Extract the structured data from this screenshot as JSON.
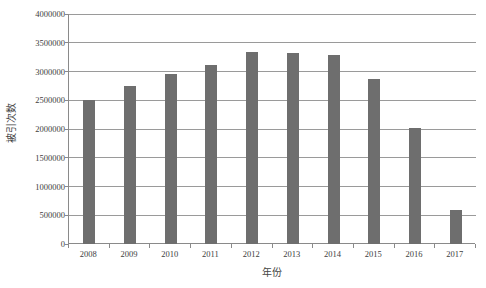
{
  "chart_data": {
    "type": "bar",
    "title": "",
    "subtitle": "",
    "xlabel": "年份",
    "ylabel": "被引次数",
    "categories": [
      "2008",
      "2009",
      "2010",
      "2011",
      "2012",
      "2013",
      "2014",
      "2015",
      "2016",
      "2017"
    ],
    "values": [
      2500000,
      2750000,
      2950000,
      3120000,
      3340000,
      3320000,
      3280000,
      2870000,
      2010000,
      600000
    ],
    "series": [
      {
        "name": "被引次数",
        "values": [
          2500000,
          2750000,
          2950000,
          3120000,
          3340000,
          3320000,
          3280000,
          2870000,
          2010000,
          600000
        ]
      }
    ],
    "ylim": [
      0,
      4000000
    ],
    "ytick_values": [
      0,
      500000,
      1000000,
      1500000,
      2000000,
      2500000,
      3000000,
      3500000,
      4000000
    ],
    "ytick_labels": [
      "0",
      "500000",
      "1000000",
      "1500000",
      "2000000",
      "2500000",
      "3000000",
      "3500000",
      "4000000"
    ],
    "xtick_labels": [
      "2008",
      "2009",
      "2010",
      "2011",
      "2012",
      "2013",
      "2014",
      "2015",
      "2016",
      "2017"
    ],
    "grid": true,
    "grid_axis": "y",
    "legend": false,
    "legend_position": "none",
    "bar_color": "#6e6e6e",
    "axis_color": "#8a8a8a",
    "gridline_color": "#9a9a9a",
    "background_color": "#ffffff",
    "annotations": []
  },
  "axes": {
    "y_title": "被引次数",
    "x_title": "年份"
  }
}
